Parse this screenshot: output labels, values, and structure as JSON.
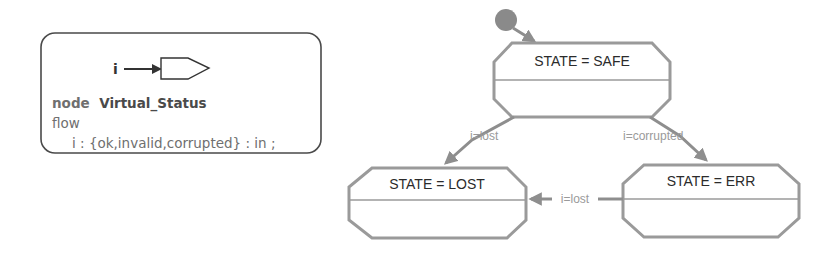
{
  "node_declaration": {
    "port_name": "i",
    "keyword_node": "node",
    "node_name": "Virtual_Status",
    "keyword_flow": "flow",
    "flow_declaration": "i : {ok,invalid,corrupted} : in ;"
  },
  "state_machine": {
    "states": [
      {
        "id": "safe",
        "label": "STATE = SAFE",
        "initial": true
      },
      {
        "id": "lost",
        "label": "STATE = LOST"
      },
      {
        "id": "err",
        "label": "STATE = ERR"
      }
    ],
    "transitions": [
      {
        "from": "safe",
        "to": "lost",
        "guard": "i=lost"
      },
      {
        "from": "safe",
        "to": "err",
        "guard": "i=corrupted"
      },
      {
        "from": "err",
        "to": "lost",
        "guard": "i=lost"
      }
    ]
  },
  "colors": {
    "state_border": "#9a9a9a",
    "transition": "#8e8e8e",
    "initial_dot": "#8a8a8a",
    "node_border": "#4a4a4a"
  }
}
